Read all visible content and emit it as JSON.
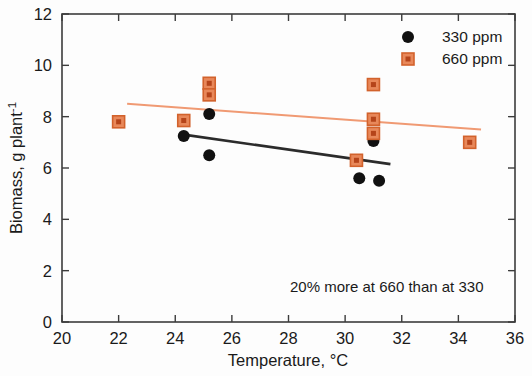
{
  "chart_data": {
    "type": "scatter",
    "title": "",
    "xlabel": "Temperature, °C",
    "ylabel_parts": {
      "main": "Biomass, g plant",
      "superscript": "-1"
    },
    "ylabel": "Biomass, g plant-1",
    "xlim": [
      20,
      36
    ],
    "ylim": [
      0,
      12
    ],
    "xticks": [
      20,
      22,
      24,
      26,
      28,
      30,
      32,
      34,
      36
    ],
    "yticks": [
      0,
      2,
      4,
      6,
      8,
      10,
      12
    ],
    "grid": false,
    "legend_position": "top-right",
    "annotation": "20% more at 660 than at 330",
    "series": [
      {
        "name": "330 ppm",
        "marker": "circle",
        "color": "#111111",
        "points": [
          {
            "x": 24.3,
            "y": 7.25
          },
          {
            "x": 25.2,
            "y": 8.1
          },
          {
            "x": 25.2,
            "y": 6.5
          },
          {
            "x": 30.5,
            "y": 5.6
          },
          {
            "x": 31.2,
            "y": 5.5
          },
          {
            "x": 31.0,
            "y": 7.05
          },
          {
            "x": 31.0,
            "y": 7.25
          }
        ],
        "trend": {
          "x1": 24.3,
          "y1": 7.3,
          "x2": 31.6,
          "y2": 6.15
        }
      },
      {
        "name": "660 ppm",
        "marker": "square",
        "color": "#e8763c",
        "fill": "#e8885a",
        "points": [
          {
            "x": 22.0,
            "y": 7.8
          },
          {
            "x": 24.3,
            "y": 7.85
          },
          {
            "x": 25.2,
            "y": 9.3
          },
          {
            "x": 25.2,
            "y": 8.85
          },
          {
            "x": 31.0,
            "y": 9.25
          },
          {
            "x": 31.0,
            "y": 7.9
          },
          {
            "x": 31.0,
            "y": 7.35
          },
          {
            "x": 30.4,
            "y": 6.3
          },
          {
            "x": 34.4,
            "y": 7.0
          }
        ],
        "trend": {
          "x1": 22.3,
          "y1": 8.5,
          "x2": 34.8,
          "y2": 7.5
        }
      }
    ]
  },
  "legend": {
    "entries": [
      {
        "label": "330 ppm",
        "marker": "circle",
        "color": "#111111"
      },
      {
        "label": "660 ppm",
        "marker": "square",
        "color": "#e8885a"
      }
    ]
  },
  "colors": {
    "series_330": "#111111",
    "series_660": "#e8885a",
    "series_660_edge": "#d2622c",
    "axis": "#3c3c3c",
    "background": "#fdfdfd",
    "text": "#1a1a1a"
  }
}
